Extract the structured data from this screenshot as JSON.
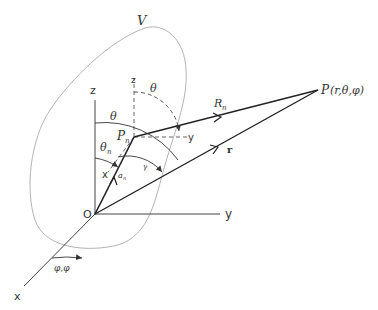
{
  "diagram": {
    "type": "spherical-coordinate-geometry",
    "region_label": "V",
    "origin_label": "O",
    "axes": {
      "x": "x",
      "y": "y",
      "z": "z"
    },
    "local_axes": {
      "z": "z",
      "y": "y",
      "x": "x"
    },
    "source_point": {
      "label": "P",
      "subscript": "n"
    },
    "field_point": {
      "label": "P",
      "coords": "(r,θ,φ)"
    },
    "vectors": {
      "source_to_field": {
        "label": "R",
        "subscript": "n"
      },
      "origin_to_field": {
        "label": "r"
      },
      "origin_to_source": {
        "label": "a",
        "subscript": "n"
      }
    },
    "angles": {
      "theta_global": "θ",
      "theta_local": "θ",
      "theta_n": {
        "label": "θ",
        "subscript": "n"
      },
      "gamma": "γ",
      "phi": "φ,φ"
    },
    "colors": {
      "lines": "#222222",
      "axes": "#444444",
      "region_outline": "#aaaaaa",
      "text": "#333333"
    }
  }
}
